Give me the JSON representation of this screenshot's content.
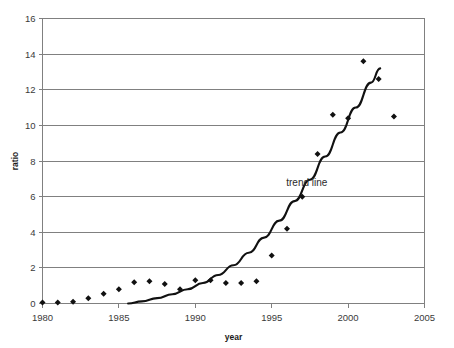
{
  "chart_data": {
    "type": "scatter",
    "title": "",
    "xlabel": "year",
    "ylabel": "ratio",
    "xlim": [
      1980,
      2005
    ],
    "ylim": [
      0,
      16
    ],
    "xticks": [
      1980,
      1985,
      1990,
      1995,
      2000,
      2005
    ],
    "yticks": [
      0,
      2,
      4,
      6,
      8,
      10,
      12,
      14,
      16
    ],
    "xtick_labels": [
      "1980",
      "1985",
      "1990",
      "1995",
      "2000",
      "2005"
    ],
    "ytick_labels": [
      "0",
      "2",
      "4",
      "6",
      "8",
      "10",
      "12",
      "14",
      "16"
    ],
    "grid": "horizontal",
    "legend": "none",
    "annotations": [
      {
        "text": "trend line",
        "x": 1997.3,
        "y": 6.6
      }
    ],
    "series": [
      {
        "name": "ratio",
        "marker": "diamond",
        "color": "#111111",
        "x": [
          1980,
          1981,
          1982,
          1983,
          1984,
          1985,
          1986,
          1987,
          1988,
          1989,
          1990,
          1991,
          1992,
          1993,
          1994,
          1995,
          1996,
          1997,
          1998,
          1999,
          2000,
          2001,
          2002,
          2003
        ],
        "y": [
          0.05,
          0.05,
          0.1,
          0.3,
          0.55,
          0.8,
          1.2,
          1.25,
          1.1,
          0.8,
          1.3,
          1.3,
          1.15,
          1.15,
          1.25,
          2.7,
          4.2,
          6.0,
          8.4,
          10.6,
          10.4,
          13.6,
          12.6,
          10.5
        ]
      },
      {
        "name": "trend line",
        "type": "line",
        "color": "#111111",
        "x": [
          1985.6,
          1986.5,
          1987.5,
          1988.5,
          1989.5,
          1990.5,
          1991.5,
          1992.5,
          1993.5,
          1994.5,
          1995.5,
          1996.5,
          1997.5,
          1998.5,
          1999.5,
          2000.5,
          2001.5,
          2002.1
        ],
        "y": [
          0.0,
          0.12,
          0.3,
          0.52,
          0.8,
          1.15,
          1.6,
          2.15,
          2.85,
          3.7,
          4.65,
          5.75,
          6.95,
          8.25,
          9.6,
          11.0,
          12.4,
          13.2
        ]
      }
    ]
  }
}
